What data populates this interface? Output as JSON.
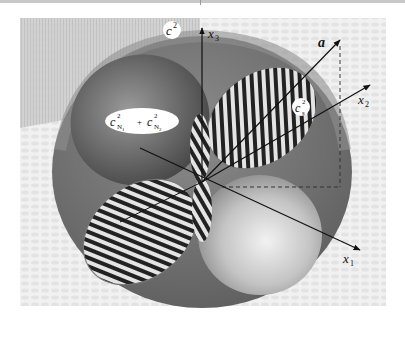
{
  "figure": {
    "labels": {
      "c_squared": "c",
      "c_squared_sup": "2",
      "axis_x1": "x",
      "axis_x1_sub": "1",
      "axis_x2": "x",
      "axis_x2_sub": "2",
      "axis_x3": "x",
      "axis_x3_sub": "3",
      "vector_a": "a",
      "cs_squared": "c",
      "cs_squared_sup": "2",
      "cs_squared_sub": "s",
      "cn_sum_first": "c",
      "cn_sum_first_sup": "2",
      "cn_sum_first_sub": "N",
      "cn_sum_first_subsub": "1",
      "cn_sum_plus": "+",
      "cn_sum_second": "c",
      "cn_sum_second_sup": "2",
      "cn_sum_second_sub": "N",
      "cn_sum_second_subsub": "2"
    },
    "colors": {
      "sphere_outer": "#6e6e6e",
      "sphere_rim": "#8a8a8a",
      "lobe_dark": "#3a3a3a",
      "lobe_light": "#d8d8d8",
      "stripe_dark": "#1e1e1e",
      "stripe_light": "#e6e6e6",
      "background_pattern": "#ebebeb",
      "label_bubble": "#ffffff"
    }
  }
}
